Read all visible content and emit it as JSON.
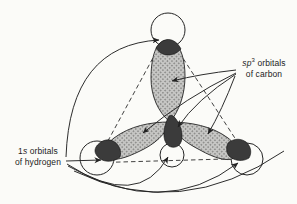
{
  "figure": {
    "description_labels_only": true
  },
  "labels": {
    "carbon": {
      "italic": "sp",
      "sup": "3",
      "rest": " orbitals",
      "line2": "of carbon"
    },
    "hydrogen": {
      "num": "1",
      "italic": "s",
      "rest": " orbitals",
      "line2": "of hydrogen"
    }
  },
  "colors": {
    "background": "#fbfbf8",
    "line": "#222222",
    "lobe_base": "#c6c6c4",
    "lobe_dot": "#7e7e7c",
    "overlap": "#3b3b3b",
    "circle_fill": "#fbfbf8"
  }
}
